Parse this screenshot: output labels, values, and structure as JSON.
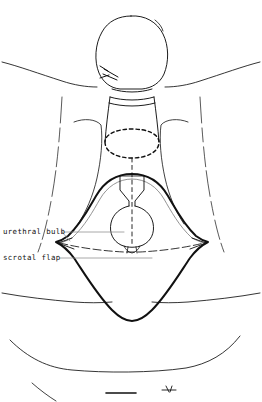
{
  "figure": {
    "type": "line-drawing",
    "background_color": "#ffffff",
    "ink_color": "#111111",
    "leader_color": "#8c8c8c",
    "view": "anterior perineal view"
  },
  "labels": {
    "urethral_bulb": "urethral  bulb",
    "scrotal_flap": "scrotal  flap"
  },
  "annotations": {
    "centerline_style": "dashed",
    "incision_marking_style": "dashed ellipse",
    "suture_tie": "ligature at coronal sulcus",
    "arrowheads": 2
  },
  "structures": [
    "glans",
    "penile shaft",
    "coronal ligature",
    "dashed circumcision line",
    "urethral bulb",
    "scrotal flap outline",
    "inguinal folds",
    "thigh contours",
    "perineal fold"
  ]
}
